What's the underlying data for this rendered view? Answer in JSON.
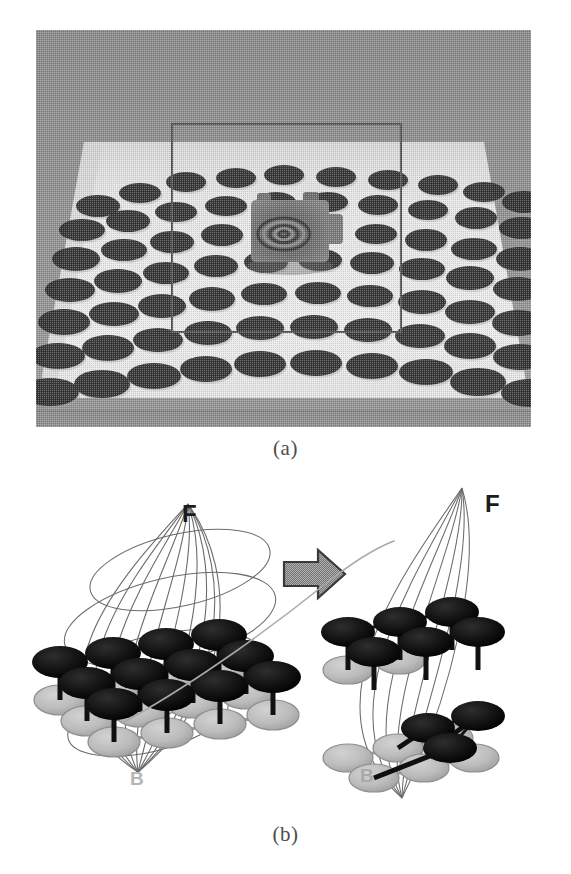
{
  "figure": {
    "panels": [
      {
        "id": "a",
        "caption": "(a)",
        "type": "photograph",
        "description": "calibration scene photograph"
      },
      {
        "id": "b",
        "caption": "(b)",
        "type": "diagram",
        "description": "gaussian sphere splitting diagram"
      }
    ]
  },
  "photo": {
    "background_color": "#8c8c8c",
    "table_color": "#e8e8e8",
    "dot_color": "#2b2b2b",
    "frame_color": "#555555",
    "shadow_color": "#6a6a6a",
    "object_color": "#6b6b6b",
    "dots": [
      [
        62,
        176,
        22,
        11
      ],
      [
        104,
        163,
        21,
        10
      ],
      [
        150,
        152,
        20,
        10
      ],
      [
        200,
        148,
        20,
        10
      ],
      [
        248,
        145,
        20,
        10
      ],
      [
        300,
        147,
        20,
        10
      ],
      [
        352,
        150,
        20,
        10
      ],
      [
        402,
        155,
        20,
        10
      ],
      [
        448,
        162,
        21,
        10
      ],
      [
        488,
        172,
        22,
        11
      ],
      [
        46,
        200,
        23,
        11
      ],
      [
        92,
        191,
        22,
        11
      ],
      [
        140,
        182,
        21,
        10
      ],
      [
        190,
        176,
        21,
        10
      ],
      [
        240,
        172,
        20,
        10
      ],
      [
        292,
        172,
        20,
        10
      ],
      [
        342,
        175,
        20,
        10
      ],
      [
        392,
        180,
        20,
        10
      ],
      [
        440,
        188,
        21,
        11
      ],
      [
        486,
        198,
        23,
        11
      ],
      [
        40,
        229,
        24,
        12
      ],
      [
        88,
        220,
        23,
        11
      ],
      [
        136,
        212,
        22,
        11
      ],
      [
        186,
        205,
        21,
        11
      ],
      [
        236,
        201,
        21,
        10
      ],
      [
        340,
        204,
        21,
        10
      ],
      [
        390,
        210,
        21,
        11
      ],
      [
        438,
        219,
        23,
        11
      ],
      [
        484,
        229,
        24,
        12
      ],
      [
        34,
        260,
        25,
        12
      ],
      [
        82,
        251,
        24,
        12
      ],
      [
        130,
        243,
        23,
        11
      ],
      [
        180,
        236,
        22,
        11
      ],
      [
        230,
        232,
        22,
        11
      ],
      [
        284,
        230,
        22,
        11
      ],
      [
        336,
        233,
        22,
        11
      ],
      [
        386,
        239,
        23,
        11
      ],
      [
        434,
        248,
        24,
        12
      ],
      [
        482,
        259,
        25,
        12
      ],
      [
        28,
        292,
        26,
        13
      ],
      [
        78,
        284,
        25,
        12
      ],
      [
        126,
        276,
        24,
        12
      ],
      [
        176,
        269,
        23,
        12
      ],
      [
        228,
        264,
        23,
        11
      ],
      [
        282,
        263,
        23,
        11
      ],
      [
        334,
        266,
        23,
        11
      ],
      [
        386,
        272,
        24,
        12
      ],
      [
        434,
        282,
        25,
        12
      ],
      [
        482,
        293,
        26,
        13
      ],
      [
        22,
        326,
        27,
        13
      ],
      [
        72,
        318,
        26,
        13
      ],
      [
        122,
        310,
        25,
        12
      ],
      [
        172,
        303,
        24,
        12
      ],
      [
        224,
        298,
        24,
        12
      ],
      [
        278,
        297,
        24,
        12
      ],
      [
        332,
        300,
        24,
        12
      ],
      [
        384,
        306,
        25,
        12
      ],
      [
        434,
        316,
        26,
        13
      ],
      [
        484,
        327,
        27,
        13
      ],
      [
        14,
        362,
        29,
        14
      ],
      [
        66,
        354,
        28,
        14
      ],
      [
        118,
        346,
        27,
        13
      ],
      [
        170,
        339,
        26,
        13
      ],
      [
        224,
        334,
        26,
        13
      ],
      [
        280,
        333,
        26,
        13
      ],
      [
        336,
        336,
        26,
        13
      ],
      [
        390,
        342,
        27,
        13
      ],
      [
        442,
        352,
        28,
        14
      ],
      [
        494,
        363,
        29,
        14
      ]
    ],
    "frame_rect": {
      "x": 136,
      "y": 94,
      "width": 229,
      "height": 208
    },
    "object": {
      "x": 215,
      "y": 170,
      "width": 78,
      "height": 62
    }
  },
  "diagram": {
    "label_F_left": "F",
    "label_B_left": "B",
    "label_F_right": "F",
    "label_B_right": "B",
    "arrow": "block-arrow-right",
    "node_dark_color": "#1a1a1a",
    "node_light_color": "#b9b9b9",
    "mesh_color": "#5a5a5a",
    "stem_color": "#111111",
    "cut_curve_color": "#9a9a9a"
  }
}
